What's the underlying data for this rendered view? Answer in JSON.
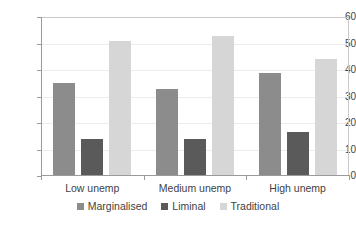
{
  "chart_data": {
    "type": "bar",
    "title": "",
    "subtitle": "",
    "xlabel": "",
    "ylabel": "",
    "categories": [
      "Low unemp",
      "Medium unemp",
      "High unemp"
    ],
    "series": [
      {
        "name": "Marginalised",
        "values": [
          35,
          33,
          39
        ],
        "color": "#8c8c8c"
      },
      {
        "name": "Liminal",
        "values": [
          14,
          14,
          16.5
        ],
        "color": "#5a5a5a"
      },
      {
        "name": "Traditional",
        "values": [
          51,
          53,
          44
        ],
        "color": "#d6d6d6"
      }
    ],
    "ylim": [
      0,
      60
    ],
    "ytick_values": [
      0,
      10,
      20,
      30,
      40,
      50,
      60
    ],
    "ytick_labels": [
      "0",
      "10",
      "20",
      "30",
      "40",
      "50",
      "60"
    ],
    "grid": true,
    "grid_axis": "y",
    "legend_position": "bottom",
    "annotations": []
  },
  "axes": {
    "y": {
      "ticks": [
        {
          "label": "60",
          "value": 60
        },
        {
          "label": "50",
          "value": 50
        },
        {
          "label": "40",
          "value": 40
        },
        {
          "label": "30",
          "value": 30
        },
        {
          "label": "20",
          "value": 20
        },
        {
          "label": "10",
          "value": 10
        },
        {
          "label": "0",
          "value": 0
        }
      ]
    },
    "x": {
      "labels": [
        "Low unemp",
        "Medium unemp",
        "High unemp"
      ]
    }
  },
  "legend": {
    "items": [
      {
        "label": "Marginalised",
        "color": "#8c8c8c"
      },
      {
        "label": "Liminal",
        "color": "#5a5a5a"
      },
      {
        "label": "Traditional",
        "color": "#d6d6d6"
      }
    ]
  },
  "style": {
    "background": "#ffffff",
    "axis_color": "#9a9a9a",
    "grid_color": "#ededed",
    "text_color": "#3f3f3f",
    "plot_border_color": "#c9c9c9"
  }
}
